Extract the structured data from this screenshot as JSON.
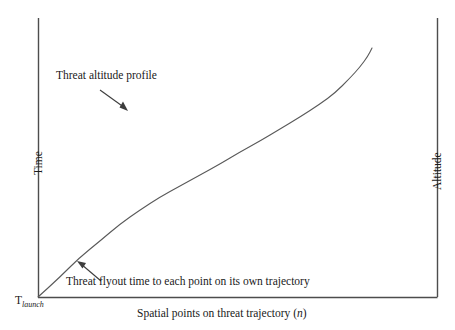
{
  "figure": {
    "background_color": "#ffffff",
    "line_color": "#595959",
    "axis_color": "#4d4d4d",
    "text_color": "#1a1a1a"
  },
  "axes": {
    "left_title": "Time",
    "right_title": "Altitude",
    "x_label_main": "Spatial points on threat trajectory (",
    "x_label_italic": "n",
    "x_label_close": ")",
    "origin_label_base": "T",
    "origin_label_sub": "launch"
  },
  "annotations": {
    "top": {
      "text": "Threat altitude profile",
      "arrow_from": [
        100,
        90
      ],
      "arrow_to": [
        128,
        111
      ]
    },
    "bottom": {
      "text": "Threat flyout time to each point on its own trajectory",
      "arrow_from": [
        101,
        281
      ],
      "arrow_to": [
        78,
        262
      ]
    }
  },
  "chart_data": {
    "type": "line",
    "title": "",
    "xlabel": "Spatial points on threat trajectory (n)",
    "ylabel": "Time",
    "ylabel_right": "Altitude",
    "grid": false,
    "legend": "none",
    "xlim": [
      0,
      1
    ],
    "ylim": [
      0,
      1
    ],
    "axis_pixels": {
      "left_axis_x": 38,
      "right_axis_x": 437,
      "axis_top_y": 18,
      "axis_bottom_y": 297
    },
    "series": [
      {
        "name": "Threat altitude profile",
        "comment": "monotonic increasing curve, concave then slightly convex; values normalized 0-1",
        "x": [
          0.0,
          0.05,
          0.1,
          0.15,
          0.2,
          0.25,
          0.3,
          0.35,
          0.4,
          0.45,
          0.5,
          0.55,
          0.6,
          0.65,
          0.7,
          0.75,
          0.8,
          0.85,
          0.9,
          0.94
        ],
        "y": [
          0.0,
          0.07,
          0.14,
          0.2,
          0.26,
          0.31,
          0.36,
          0.4,
          0.44,
          0.48,
          0.52,
          0.56,
          0.6,
          0.64,
          0.69,
          0.73,
          0.78,
          0.83,
          0.88,
          0.92
        ],
        "pixel_points": [
          [
            38,
            297
          ],
          [
            59,
            278
          ],
          [
            79,
            258
          ],
          [
            100,
            241
          ],
          [
            120,
            224
          ],
          [
            140,
            210
          ],
          [
            160,
            197
          ],
          [
            180,
            186
          ],
          [
            200,
            175
          ],
          [
            220,
            164
          ],
          [
            240,
            152
          ],
          [
            260,
            141
          ],
          [
            280,
            129
          ],
          [
            300,
            117
          ],
          [
            320,
            104
          ],
          [
            335,
            93
          ],
          [
            350,
            78
          ],
          [
            360,
            67
          ],
          [
            368,
            56
          ],
          [
            372,
            48
          ]
        ]
      }
    ]
  }
}
